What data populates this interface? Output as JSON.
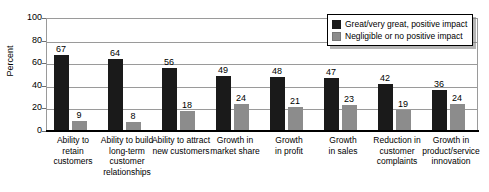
{
  "chart_data": {
    "type": "bar",
    "title": "",
    "xlabel": "",
    "ylabel": "Percent",
    "ylim": [
      0,
      100
    ],
    "yticks": [
      0,
      20,
      40,
      60,
      80,
      100
    ],
    "grid": true,
    "legend_position": "top-right",
    "categories": [
      "Ability to retain customers",
      "Ability to build long-term customer relationships",
      "Ability to attract new customers",
      "Growth in market share",
      "Growth in profit",
      "Growth in sales",
      "Reduction in customer complaints",
      "Growth in product/service innovation"
    ],
    "category_lines": [
      [
        "Ability to",
        "retain",
        "customers"
      ],
      [
        "Ability to build",
        "long-term",
        "customer",
        "relationships"
      ],
      [
        "Ability to attract",
        "new customers"
      ],
      [
        "Growth in",
        "market share"
      ],
      [
        "Growth",
        "in profit"
      ],
      [
        "Growth",
        "in sales"
      ],
      [
        "Reduction in",
        "customer",
        "complaints"
      ],
      [
        "Growth in",
        "product/service",
        "innovation"
      ]
    ],
    "series": [
      {
        "name": "Great/very great, positive impact",
        "color": "#1a1a1a",
        "values": [
          67,
          64,
          56,
          49,
          48,
          47,
          42,
          36
        ]
      },
      {
        "name": "Negligible or no positive impact",
        "color": "#8c8c8c",
        "values": [
          9,
          8,
          18,
          24,
          21,
          23,
          19,
          24
        ]
      }
    ]
  },
  "legend": {
    "items": [
      {
        "label": "Great/very great, positive impact",
        "swatch": "dark"
      },
      {
        "label": "Negligible or no positive impact",
        "swatch": "light"
      }
    ]
  },
  "colors": {
    "dark_bar": "#1a1a1a",
    "light_bar": "#8c8c8c",
    "gridline": "#9a9a9a",
    "axis": "#000000"
  }
}
